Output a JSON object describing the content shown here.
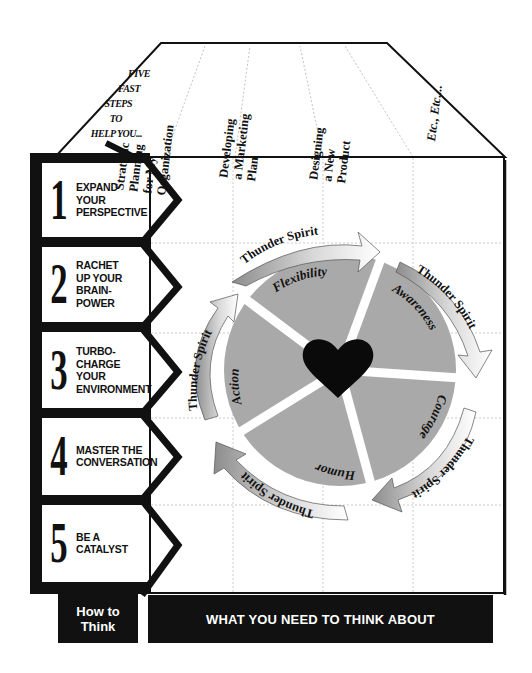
{
  "header": {
    "intro_lines": [
      "FIVE",
      "FAST",
      "STEPS",
      "TO",
      "HELP YOU..."
    ],
    "columns": [
      {
        "lines": [
          "Strategic",
          "Planning",
          "for My",
          "Organization"
        ]
      },
      {
        "lines": [
          "Developing",
          "a Marketing",
          "Plan"
        ]
      },
      {
        "lines": [
          "Designing",
          "a New",
          "Product"
        ]
      },
      {
        "lines": [
          "Etc., Etc...."
        ]
      }
    ]
  },
  "steps": [
    {
      "number": "1",
      "lines": [
        "EXPAND",
        "YOUR",
        "PERSPECTIVE"
      ]
    },
    {
      "number": "2",
      "lines": [
        "RACHET",
        "UP YOUR",
        "BRAIN-",
        "POWER"
      ]
    },
    {
      "number": "3",
      "lines": [
        "TURBO-",
        "CHARGE",
        "YOUR",
        "ENVIRONMENT"
      ]
    },
    {
      "number": "4",
      "lines": [
        "MASTER THE",
        "CONVERSATION"
      ]
    },
    {
      "number": "5",
      "lines": [
        "BE A",
        "CATALYST"
      ]
    }
  ],
  "wheel": {
    "center_icon": "heart-icon",
    "segments": [
      "Flexibility",
      "Awareness",
      "Courage",
      "Humor",
      "Action"
    ],
    "arrow_label": "Thunder Spirit",
    "arrow_count": 5,
    "segment_color": "#a9a9a9",
    "heart_color": "#0a0a0a"
  },
  "footer": {
    "left_label_lines": [
      "How to",
      "Think"
    ],
    "right_label": "WHAT YOU NEED TO THINK ABOUT"
  }
}
